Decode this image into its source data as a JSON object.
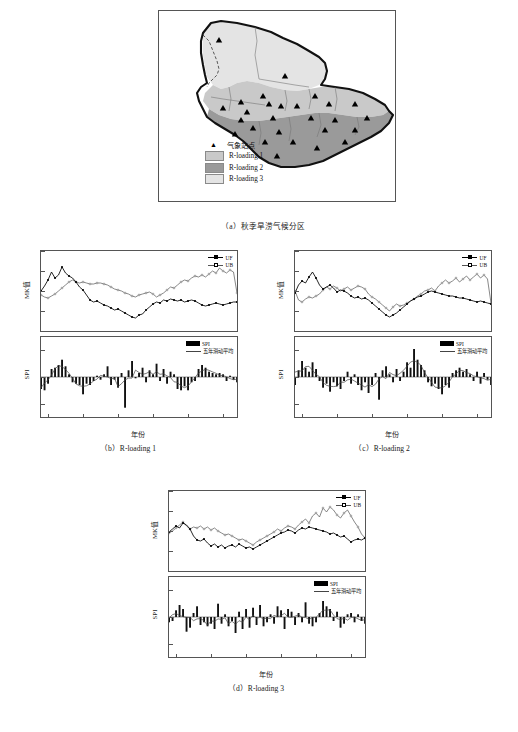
{
  "figure": {
    "panels": [
      {
        "id": "a",
        "caption": "（a）秋季旱涝气候分区"
      },
      {
        "id": "b",
        "caption": "（b）R-loading 1"
      },
      {
        "id": "c",
        "caption": "（c）R-loading 2"
      },
      {
        "id": "d",
        "caption": "（d）R-loading 3"
      }
    ]
  },
  "map": {
    "lat_ticks": [
      "54°N",
      "52°N",
      "50°N",
      "48°N",
      "46°N",
      "44°N"
    ],
    "lat_values": [
      54,
      52,
      50,
      48,
      46,
      44
    ],
    "lon_ticks": [
      "120°E",
      "122°E",
      "124°E",
      "126°E",
      "128°E",
      "130°E",
      "132°E",
      "134°E"
    ],
    "lon_values": [
      120,
      122,
      124,
      126,
      128,
      130,
      132,
      134
    ],
    "legend": [
      {
        "symbol": "triangle",
        "label": "气象站点",
        "color": "#000000"
      },
      {
        "symbol": "swatch",
        "label": "R-loading 1",
        "color": "#c9c9c9"
      },
      {
        "symbol": "swatch",
        "label": "R-loading 2",
        "color": "#9a9a9a"
      },
      {
        "symbol": "swatch",
        "label": "R-loading 3",
        "color": "#e4e4e4"
      }
    ],
    "station_count": 27,
    "stations": [
      [
        124.1,
        52.6
      ],
      [
        127.5,
        49.5
      ],
      [
        125.9,
        48.0
      ],
      [
        124.6,
        47.5
      ],
      [
        126.3,
        47.4
      ],
      [
        129.5,
        48.0
      ],
      [
        127.0,
        47.2
      ],
      [
        123.9,
        46.9
      ],
      [
        125.2,
        46.6
      ],
      [
        128.1,
        47.0
      ],
      [
        130.3,
        47.3
      ],
      [
        131.9,
        47.4
      ],
      [
        126.6,
        46.2
      ],
      [
        124.6,
        46.1
      ],
      [
        129.2,
        46.3
      ],
      [
        131.0,
        46.2
      ],
      [
        133.0,
        46.3
      ],
      [
        125.3,
        45.6
      ],
      [
        127.3,
        45.4
      ],
      [
        130.4,
        45.5
      ],
      [
        132.6,
        45.4
      ],
      [
        126.0,
        44.9
      ],
      [
        128.2,
        44.9
      ],
      [
        124.3,
        45.2
      ],
      [
        129.8,
        44.6
      ],
      [
        126.9,
        44.3
      ],
      [
        131.6,
        44.9
      ]
    ]
  },
  "chart_data": [
    {
      "panel": "b",
      "region": "R-loading 1",
      "type": "line",
      "title": "",
      "xlabel": "年份",
      "ylabel": "MK值",
      "xlim": [
        1958,
        2014
      ],
      "ylim": [
        -4,
        4
      ],
      "yticks": [
        4,
        2,
        0,
        -2
      ],
      "xticks": [
        1960,
        1970,
        1980,
        1990,
        2000,
        2010
      ],
      "legend": [
        {
          "name": "UF",
          "marker": "filled-square"
        },
        {
          "name": "UB",
          "marker": "open-circle"
        }
      ],
      "series": [
        {
          "name": "UF",
          "values": [
            0.0,
            0.5,
            1.1,
            1.9,
            1.3,
            1.6,
            2.4,
            1.8,
            1.5,
            1.3,
            0.9,
            0.4,
            0.1,
            -0.4,
            -0.9,
            -1.1,
            -1.0,
            -1.2,
            -1.4,
            -1.5,
            -1.7,
            -1.9,
            -1.8,
            -2.0,
            -2.2,
            -2.4,
            -2.6,
            -2.7,
            -2.4,
            -2.3,
            -1.9,
            -1.6,
            -1.3,
            -1.1,
            -1.2,
            -0.9,
            -1.0,
            -0.8,
            -0.9,
            -1.0,
            -0.9,
            -1.1,
            -1.0,
            -0.9,
            -1.0,
            -1.2,
            -1.4,
            -1.5,
            -1.4,
            -1.3,
            -1.2,
            -1.3,
            -1.4,
            -1.3,
            -1.2,
            -1.1,
            -1.1
          ]
        },
        {
          "name": "UB",
          "values": [
            -0.4,
            -0.6,
            -0.7,
            -0.5,
            -0.3,
            0.0,
            0.3,
            0.6,
            0.9,
            1.1,
            0.9,
            0.8,
            0.9,
            0.8,
            0.7,
            0.7,
            0.8,
            0.8,
            0.7,
            0.6,
            0.4,
            0.2,
            0.1,
            0.0,
            -0.2,
            -0.3,
            -0.5,
            -0.6,
            -0.4,
            -0.3,
            -0.2,
            -0.1,
            -0.3,
            -0.6,
            -0.4,
            -0.2,
            0.1,
            0.4,
            0.3,
            0.6,
            0.9,
            1.1,
            1.0,
            1.3,
            1.5,
            1.4,
            1.6,
            1.4,
            1.7,
            2.0,
            1.8,
            2.3,
            2.0,
            1.8,
            2.1,
            1.9,
            -0.2
          ]
        }
      ],
      "spi": {
        "type": "bar",
        "ylabel": "SPI",
        "ylim": [
          -3,
          3
        ],
        "yticks": [
          2,
          0,
          -2
        ],
        "legend": [
          {
            "name": "SPI",
            "marker": "bar"
          },
          {
            "name": "五年滑动平均",
            "marker": "line"
          }
        ],
        "years": [
          1958,
          1959,
          1960,
          1961,
          1962,
          1963,
          1964,
          1965,
          1966,
          1967,
          1968,
          1969,
          1970,
          1971,
          1972,
          1973,
          1974,
          1975,
          1976,
          1977,
          1978,
          1979,
          1980,
          1981,
          1982,
          1983,
          1984,
          1985,
          1986,
          1987,
          1988,
          1989,
          1990,
          1991,
          1992,
          1993,
          1994,
          1995,
          1996,
          1997,
          1998,
          1999,
          2000,
          2001,
          2002,
          2003,
          2004,
          2005,
          2006,
          2007,
          2008,
          2009,
          2010,
          2011,
          2012,
          2013,
          2014
        ],
        "values": [
          -0.9,
          -1.0,
          -0.5,
          0.6,
          0.7,
          0.9,
          1.3,
          0.8,
          0.2,
          -0.4,
          -0.5,
          -0.6,
          -1.3,
          -0.5,
          -0.6,
          -0.3,
          0.1,
          -0.2,
          0.2,
          0.8,
          -0.6,
          -0.2,
          -0.8,
          0.3,
          -2.3,
          0.5,
          1.2,
          -0.1,
          0.3,
          0.7,
          -0.4,
          0.5,
          0.2,
          1.0,
          -0.3,
          0.6,
          -0.5,
          0.4,
          0.2,
          -0.9,
          -1.0,
          -0.7,
          -1.0,
          -0.4,
          -0.3,
          0.6,
          0.9,
          0.7,
          0.4,
          0.3,
          0.2,
          0.3,
          0.2,
          -0.3,
          0.1,
          -0.2,
          -0.4
        ]
      }
    },
    {
      "panel": "c",
      "region": "R-loading 2",
      "type": "line",
      "title": "",
      "xlabel": "年份",
      "ylabel": "MK值",
      "xlim": [
        1958,
        2014
      ],
      "ylim": [
        -4,
        4
      ],
      "yticks": [
        4,
        2,
        0,
        -2
      ],
      "xticks": [
        1960,
        1970,
        1980,
        1990,
        2000,
        2010
      ],
      "legend": [
        {
          "name": "UF",
          "marker": "filled-square"
        },
        {
          "name": "UB",
          "marker": "open-circle"
        }
      ],
      "series": [
        {
          "name": "UF",
          "values": [
            -0.2,
            0.6,
            1.0,
            0.8,
            1.4,
            1.9,
            1.3,
            0.6,
            0.2,
            0.4,
            0.6,
            0.3,
            -0.1,
            0.1,
            0.0,
            -0.2,
            -0.5,
            -0.7,
            -0.6,
            -0.8,
            -0.7,
            -0.9,
            -1.2,
            -1.5,
            -1.8,
            -2.1,
            -2.4,
            -2.6,
            -2.4,
            -2.2,
            -1.9,
            -1.6,
            -1.3,
            -1.0,
            -0.8,
            -0.6,
            -0.5,
            -0.3,
            -0.1,
            0.0,
            -0.1,
            -0.2,
            -0.3,
            -0.4,
            -0.5,
            -0.5,
            -0.6,
            -0.7,
            -0.7,
            -0.8,
            -0.9,
            -1.0,
            -1.1,
            -1.0,
            -1.1,
            -1.2,
            -1.3
          ]
        },
        {
          "name": "UB",
          "values": [
            0.0,
            -0.9,
            -1.1,
            -0.8,
            -0.6,
            -0.7,
            -0.5,
            -0.3,
            0.1,
            0.4,
            0.2,
            0.5,
            0.3,
            0.0,
            0.2,
            0.4,
            0.1,
            0.3,
            0.5,
            0.4,
            0.2,
            -0.3,
            -0.6,
            -0.8,
            -1.1,
            -1.4,
            -1.7,
            -2.0,
            -1.6,
            -1.3,
            -1.5,
            -1.4,
            -1.2,
            -1.0,
            -0.8,
            -0.5,
            -0.3,
            0.0,
            0.1,
            0.3,
            0.0,
            0.5,
            0.8,
            1.1,
            0.8,
            1.0,
            1.3,
            0.9,
            1.2,
            1.5,
            1.1,
            1.4,
            1.7,
            1.3,
            1.6,
            1.2,
            -1.2
          ]
        }
      ],
      "spi": {
        "type": "bar",
        "ylabel": "SPI",
        "ylim": [
          -3,
          3
        ],
        "yticks": [
          2,
          0,
          -2
        ],
        "legend": [
          {
            "name": "SPI",
            "marker": "bar"
          },
          {
            "name": "五年滑动平均",
            "marker": "line"
          }
        ],
        "years": [
          1958,
          1959,
          1960,
          1961,
          1962,
          1963,
          1964,
          1965,
          1966,
          1967,
          1968,
          1969,
          1970,
          1971,
          1972,
          1973,
          1974,
          1975,
          1976,
          1977,
          1978,
          1979,
          1980,
          1981,
          1982,
          1983,
          1984,
          1985,
          1986,
          1987,
          1988,
          1989,
          1990,
          1991,
          1992,
          1993,
          1994,
          1995,
          1996,
          1997,
          1998,
          1999,
          2000,
          2001,
          2002,
          2003,
          2004,
          2005,
          2006,
          2007,
          2008,
          2009,
          2010,
          2011,
          2012,
          2013,
          2014
        ],
        "values": [
          -0.6,
          0.5,
          1.2,
          0.7,
          0.4,
          1.1,
          0.6,
          -0.3,
          -0.8,
          -0.5,
          -1.1,
          -0.4,
          -0.7,
          -0.9,
          -0.3,
          0.4,
          -0.5,
          0.2,
          -0.6,
          -1.0,
          -0.4,
          -1.2,
          -0.6,
          0.3,
          -1.7,
          0.5,
          0.8,
          0.2,
          -0.4,
          0.6,
          -0.3,
          0.4,
          1.1,
          0.7,
          2.1,
          1.3,
          0.9,
          0.5,
          -0.4,
          -0.7,
          -0.5,
          -0.9,
          -1.3,
          -0.6,
          -0.8,
          0.3,
          0.5,
          0.7,
          0.4,
          0.6,
          0.2,
          -0.3,
          0.4,
          -0.5,
          0.3,
          -0.2,
          -0.6
        ]
      }
    },
    {
      "panel": "d",
      "region": "R-loading 3",
      "type": "line",
      "title": "",
      "xlabel": "年份",
      "ylabel": "MK值",
      "xlim": [
        1958,
        2014
      ],
      "ylim": [
        -4,
        4
      ],
      "yticks": [
        4,
        2,
        0,
        -2
      ],
      "xticks": [
        1960,
        1970,
        1980,
        1990,
        2000,
        2010
      ],
      "legend": [
        {
          "name": "UF",
          "marker": "filled-square"
        },
        {
          "name": "UB",
          "marker": "open-circle"
        }
      ],
      "series": [
        {
          "name": "UF",
          "values": [
            -0.1,
            0.2,
            0.5,
            0.3,
            0.8,
            0.6,
            0.2,
            -0.5,
            -0.9,
            -1.0,
            -0.8,
            -1.2,
            -1.5,
            -1.3,
            -1.6,
            -1.4,
            -1.7,
            -1.5,
            -1.4,
            -1.6,
            -1.3,
            -1.5,
            -1.7,
            -1.6,
            -1.8,
            -1.6,
            -1.4,
            -1.2,
            -1.0,
            -0.8,
            -0.6,
            -0.4,
            -0.2,
            -0.1,
            0.1,
            0.0,
            -0.2,
            0.1,
            0.3,
            0.2,
            0.4,
            0.3,
            0.2,
            0.1,
            0.0,
            -0.1,
            -0.3,
            -0.2,
            -0.4,
            -0.6,
            -0.5,
            -0.8,
            -1.1,
            -0.9,
            -0.8,
            -0.9,
            -0.7
          ]
        },
        {
          "name": "UB",
          "values": [
            -0.2,
            0.0,
            0.3,
            0.6,
            0.9,
            0.5,
            0.2,
            0.4,
            0.3,
            0.5,
            0.2,
            0.4,
            0.1,
            0.3,
            0.0,
            -0.2,
            -0.4,
            -0.3,
            -0.5,
            -0.7,
            -0.9,
            -0.8,
            -1.0,
            -1.2,
            -1.4,
            -1.1,
            -0.9,
            -0.7,
            -0.5,
            -0.3,
            -0.1,
            0.2,
            0.0,
            0.3,
            0.5,
            0.4,
            0.2,
            0.6,
            0.9,
            1.2,
            0.8,
            1.5,
            1.8,
            1.4,
            2.3,
            1.9,
            2.4,
            2.1,
            1.6,
            1.3,
            1.8,
            2.1,
            1.5,
            0.9,
            0.4,
            -0.3,
            -0.7
          ]
        }
      ],
      "spi": {
        "type": "bar",
        "ylabel": "SPI",
        "ylim": [
          -3,
          3
        ],
        "yticks": [
          2,
          0,
          -2
        ],
        "legend": [
          {
            "name": "SPI",
            "marker": "bar"
          },
          {
            "name": "五年滑动平均",
            "marker": "line"
          }
        ],
        "years": [
          1958,
          1959,
          1960,
          1961,
          1962,
          1963,
          1964,
          1965,
          1966,
          1967,
          1968,
          1969,
          1970,
          1971,
          1972,
          1973,
          1974,
          1975,
          1976,
          1977,
          1978,
          1979,
          1980,
          1981,
          1982,
          1983,
          1984,
          1985,
          1986,
          1987,
          1988,
          1989,
          1990,
          1991,
          1992,
          1993,
          1994,
          1995,
          1996,
          1997,
          1998,
          1999,
          2000,
          2001,
          2002,
          2003,
          2004,
          2005,
          2006,
          2007,
          2008,
          2009,
          2010,
          2011,
          2012,
          2013,
          2014
        ],
        "values": [
          -0.4,
          -0.3,
          0.5,
          0.9,
          0.6,
          -1.1,
          -0.8,
          0.3,
          0.8,
          -0.6,
          -0.4,
          -0.7,
          -0.5,
          -0.9,
          1.0,
          -0.5,
          0.2,
          -0.7,
          -0.3,
          -1.2,
          0.4,
          -0.9,
          0.6,
          -0.8,
          0.7,
          -0.6,
          0.9,
          -0.7,
          -0.4,
          0.2,
          -0.5,
          0.8,
          0.5,
          -0.9,
          0.6,
          0.4,
          -0.6,
          0.3,
          -0.4,
          1.1,
          -0.5,
          -0.7,
          -0.4,
          0.3,
          1.2,
          0.8,
          0.6,
          -0.3,
          0.4,
          -0.8,
          -0.5,
          0.2,
          0.3,
          -0.4,
          0.2,
          -0.3,
          -0.5
        ]
      }
    }
  ]
}
